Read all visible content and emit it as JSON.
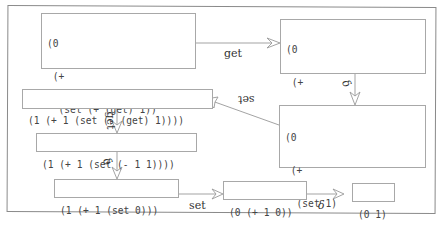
{
  "diagram": {
    "nodes": [
      {
        "id": "a",
        "lines": [
          "(0",
          " (+",
          "  (set (+ (get) 1))",
          "  (set (- (get) 1))))"
        ]
      },
      {
        "id": "b",
        "lines": [
          "(0",
          " (+",
          "  (set (+ 0 1))",
          "  (set (- (get) 1))))"
        ]
      },
      {
        "id": "c",
        "lines": [
          "(0",
          " (+",
          "  (set 1)",
          "  (set (- (get) 1))))"
        ]
      },
      {
        "id": "d",
        "lines": [
          "(1 (+ 1 (set (- (get) 1))))"
        ]
      },
      {
        "id": "e",
        "lines": [
          "(1 (+ 1 (set (- 1 1))))"
        ]
      },
      {
        "id": "f",
        "lines": [
          "(1 (+ 1 (set 0)))"
        ]
      },
      {
        "id": "g",
        "lines": [
          "(0 (+ 1 0))"
        ]
      },
      {
        "id": "h",
        "lines": [
          "(0 1)"
        ]
      }
    ],
    "edges": [
      {
        "from": "a",
        "to": "b",
        "label": "get"
      },
      {
        "from": "b",
        "to": "c",
        "label": "δ"
      },
      {
        "from": "c",
        "to": "d",
        "label": "set"
      },
      {
        "from": "d",
        "to": "e",
        "label": "get"
      },
      {
        "from": "e",
        "to": "f",
        "label": "δ"
      },
      {
        "from": "f",
        "to": "g",
        "label": "set"
      },
      {
        "from": "g",
        "to": "h",
        "label": "δ"
      }
    ]
  }
}
